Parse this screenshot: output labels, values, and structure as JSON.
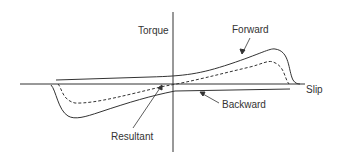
{
  "diagram": {
    "labels": {
      "y_axis": "Torque",
      "x_axis": "Slip",
      "forward": "Forward",
      "backward": "Backward",
      "resultant": "Resultant"
    },
    "curves": [
      {
        "name": "Forward",
        "style": "solid"
      },
      {
        "name": "Backward",
        "style": "solid"
      },
      {
        "name": "Resultant",
        "style": "dashed"
      }
    ],
    "colors": {
      "line": "#333333",
      "text": "#333333",
      "background": "#ffffff"
    }
  }
}
